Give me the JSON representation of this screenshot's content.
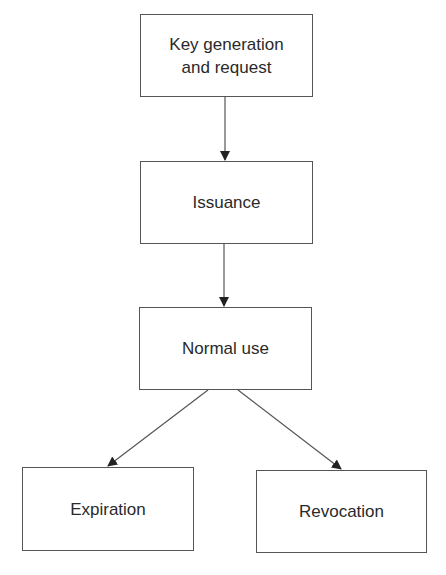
{
  "diagram": {
    "type": "flowchart",
    "nodes": [
      {
        "id": "keygen",
        "label_line1": "Key generation",
        "label_line2": "and request"
      },
      {
        "id": "issuance",
        "label": "Issuance"
      },
      {
        "id": "normal_use",
        "label": "Normal use"
      },
      {
        "id": "expiration",
        "label": "Expiration"
      },
      {
        "id": "revocation",
        "label": "Revocation"
      }
    ],
    "edges": [
      {
        "from": "keygen",
        "to": "issuance"
      },
      {
        "from": "issuance",
        "to": "normal_use"
      },
      {
        "from": "normal_use",
        "to": "expiration"
      },
      {
        "from": "normal_use",
        "to": "revocation"
      }
    ],
    "colors": {
      "line": "#555555",
      "arrowhead": "#222222",
      "text": "#2a2a2a",
      "background": "#ffffff"
    }
  }
}
